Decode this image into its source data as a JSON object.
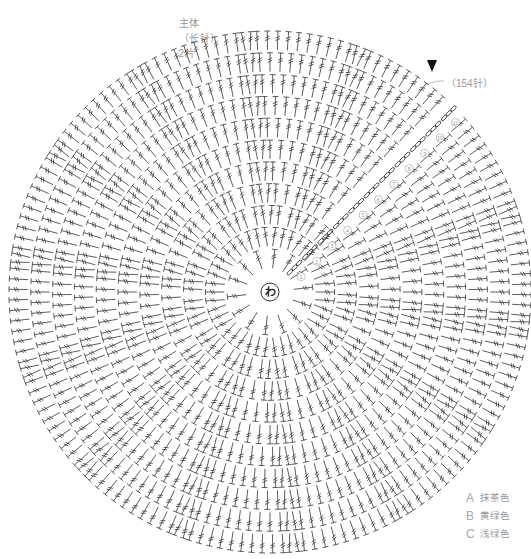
{
  "title": {
    "part": "主体",
    "stitch_type": "（长针）",
    "quantity": "2片"
  },
  "chart": {
    "center_label": "わ",
    "center": [
      270,
      292
    ],
    "rounds": 11,
    "stitches_per_round_increment": 14,
    "outer_radius": 262,
    "inner_radius": 22,
    "stitch_color": "#333333",
    "round_number_color": "#9a9a9a",
    "start_marker": "triangle-down",
    "start_angle_deg": -45,
    "round_numbers": [
      "1",
      "2",
      "3",
      "4",
      "5",
      "6",
      "7",
      "8",
      "9",
      "10",
      "11"
    ]
  },
  "stitch_count_label": "（154针）",
  "legend": {
    "items": [
      {
        "key": "A",
        "label": "抹茶色"
      },
      {
        "key": "B",
        "label": "黄绿色"
      },
      {
        "key": "C",
        "label": "浅绿色"
      }
    ]
  }
}
